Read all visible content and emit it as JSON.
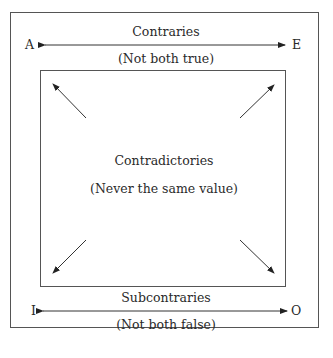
{
  "diagram": {
    "type": "square-of-opposition",
    "corners": {
      "top_left": "A",
      "top_right": "E",
      "bottom_left": "I",
      "bottom_right": "O"
    },
    "top": {
      "title": "Contraries",
      "subtitle": "(Not both true)"
    },
    "center": {
      "title": "Contradictories",
      "subtitle": "(Never the same value)"
    },
    "bottom": {
      "title": "Subcontraries",
      "subtitle": "(Not both false)"
    }
  }
}
